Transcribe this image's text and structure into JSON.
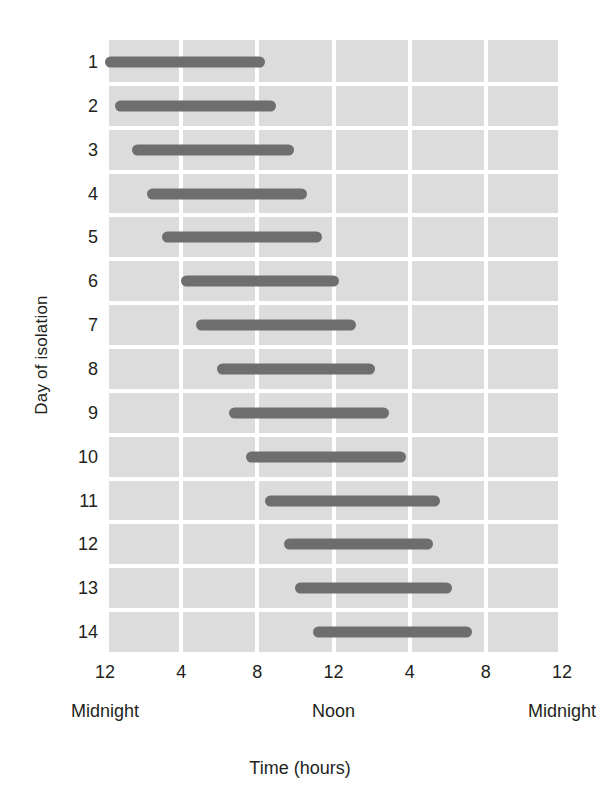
{
  "chart_data": {
    "type": "bar",
    "orientation": "horizontal",
    "subtype": "gantt-range",
    "title": "",
    "xlabel": "Time (hours)",
    "ylabel": "Day of isolation",
    "xlim": [
      0,
      24
    ],
    "ylim": [
      0.5,
      14.5
    ],
    "grid": true,
    "legend": false,
    "background_color": "#dcdcdc",
    "gridline_color": "#ffffff",
    "bar_color": "#6e6e6e",
    "x_tick_values": [
      0,
      4,
      8,
      12,
      16,
      20,
      24
    ],
    "x_tick_labels": [
      "12",
      "4",
      "8",
      "12",
      "4",
      "8",
      "12"
    ],
    "x_period_markers": [
      {
        "value": 0,
        "label": "Midnight"
      },
      {
        "value": 12,
        "label": "Noon"
      },
      {
        "value": 24,
        "label": "Midnight"
      }
    ],
    "categories": [
      "1",
      "2",
      "3",
      "4",
      "5",
      "6",
      "7",
      "8",
      "9",
      "10",
      "11",
      "12",
      "13",
      "14"
    ],
    "bars": [
      {
        "day": 1,
        "start": 0.0,
        "end": 8.4
      },
      {
        "day": 2,
        "start": 0.5,
        "end": 9.0
      },
      {
        "day": 3,
        "start": 1.4,
        "end": 9.9
      },
      {
        "day": 4,
        "start": 2.2,
        "end": 10.6
      },
      {
        "day": 5,
        "start": 3.0,
        "end": 11.4
      },
      {
        "day": 6,
        "start": 4.0,
        "end": 12.3
      },
      {
        "day": 7,
        "start": 4.8,
        "end": 13.2
      },
      {
        "day": 8,
        "start": 5.9,
        "end": 14.2
      },
      {
        "day": 9,
        "start": 6.5,
        "end": 14.9
      },
      {
        "day": 10,
        "start": 7.4,
        "end": 15.8
      },
      {
        "day": 11,
        "start": 8.4,
        "end": 17.6
      },
      {
        "day": 12,
        "start": 9.4,
        "end": 17.2
      },
      {
        "day": 13,
        "start": 10.0,
        "end": 18.2
      },
      {
        "day": 14,
        "start": 10.9,
        "end": 19.3
      }
    ]
  }
}
